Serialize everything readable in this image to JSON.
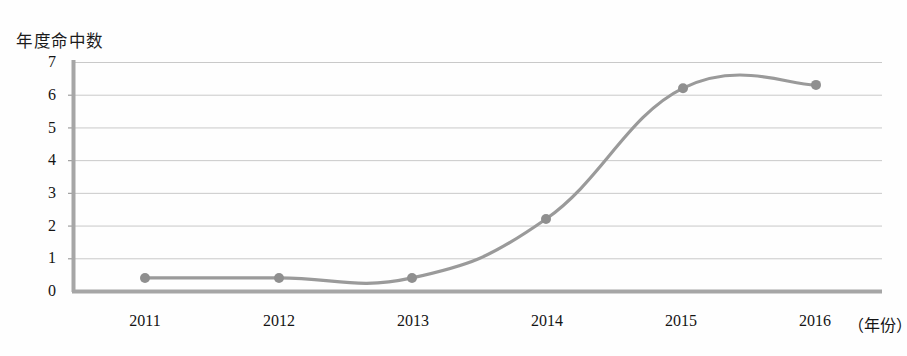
{
  "chart_data": {
    "type": "line",
    "title": "",
    "ylabel": "年度命中数",
    "xlabel": "（年份）",
    "categories": [
      "2011",
      "2012",
      "2013",
      "2014",
      "2015",
      "2016"
    ],
    "values": [
      0.4,
      0.4,
      0.4,
      2.2,
      6.2,
      6.3
    ],
    "series": [
      {
        "name": "年度命中数",
        "values": [
          0.4,
          0.4,
          0.4,
          2.2,
          6.2,
          6.3
        ]
      }
    ],
    "ylim": [
      0,
      7
    ],
    "yticks": [
      "0",
      "1",
      "2",
      "3",
      "4",
      "5",
      "6",
      "7"
    ],
    "xticks": [
      "2011",
      "2012",
      "2013",
      "2014",
      "2015",
      "2016"
    ],
    "grid": "horizontal",
    "legend": "none",
    "line_color": "#9a9a9a",
    "marker_color": "#8f8f8f",
    "grid_color": "#c8c8c8",
    "axis_color": "#9c9c9c",
    "smoothing": "spline"
  },
  "axes": {
    "y_axis_label": "年度命中数",
    "x_axis_unit": "（年份）",
    "y_ticks": [
      {
        "label": "7",
        "value": 7
      },
      {
        "label": "6",
        "value": 6
      },
      {
        "label": "5",
        "value": 5
      },
      {
        "label": "4",
        "value": 4
      },
      {
        "label": "3",
        "value": 3
      },
      {
        "label": "2",
        "value": 2
      },
      {
        "label": "1",
        "value": 1
      },
      {
        "label": "0",
        "value": 0
      }
    ],
    "x_ticks": [
      {
        "label": "2011",
        "value": 2011
      },
      {
        "label": "2012",
        "value": 2012
      },
      {
        "label": "2013",
        "value": 2013
      },
      {
        "label": "2014",
        "value": 2014
      },
      {
        "label": "2015",
        "value": 2015
      },
      {
        "label": "2016",
        "value": 2016
      }
    ]
  },
  "colors": {
    "line": "#9a9a9a",
    "marker": "#8d8d8d",
    "grid": "#c9c9c9",
    "axis": "#9e9e9e",
    "text": "#141414",
    "background": "#fefefe"
  }
}
